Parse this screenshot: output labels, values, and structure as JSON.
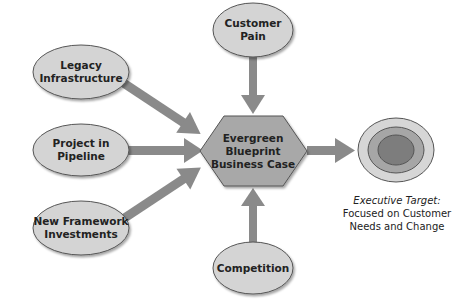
{
  "diagram": {
    "center": {
      "line1": "Evergreen",
      "line2": "Blueprint",
      "line3": "Business Case"
    },
    "inputs": {
      "top": {
        "line1": "Customer",
        "line2": "Pain"
      },
      "bottom": {
        "line1": "Competition"
      },
      "left1": {
        "line1": "Legacy",
        "line2": "Infrastructure"
      },
      "left2": {
        "line1": "Project in",
        "line2": "Pipeline"
      },
      "left3": {
        "line1": "New Framework",
        "line2": "Investments"
      }
    },
    "target": {
      "line1": "Executive Target:",
      "line2": "Focused on Customer",
      "line3": "Needs and Change"
    },
    "colors": {
      "node_fill": "#d4d4d4",
      "hex_fill": "#a8a8a8",
      "arrow": "#8a8a8a",
      "stroke": "#555555",
      "ring_outer": "#d6d6d6",
      "ring_mid": "#a6a6a6",
      "ring_inner": "#7d7d7d"
    }
  }
}
